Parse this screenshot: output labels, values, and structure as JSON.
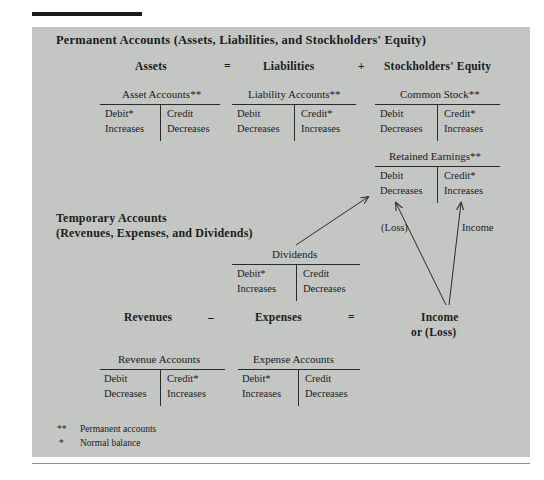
{
  "figure": {
    "permanent_heading": "Permanent Accounts (Assets, Liabilities, and Stockholders' Equity)",
    "temporary_heading_line1": "Temporary Accounts",
    "temporary_heading_line2": "(Revenues, Expenses, and Dividends)"
  },
  "equation_top": {
    "assets": "Assets",
    "equals": "=",
    "liabilities": "Liabilities",
    "plus": "+",
    "stockholders_equity": "Stockholders' Equity"
  },
  "equation_bottom": {
    "revenues": "Revenues",
    "minus": "–",
    "expenses": "Expenses",
    "equals": "=",
    "income_line1": "Income",
    "income_line2": "or (Loss)"
  },
  "t_accounts": [
    {
      "id": "asset-accounts",
      "title": "Asset Accounts**",
      "debit_label": "Debit*",
      "debit_effect": "Increases",
      "credit_label": "Credit",
      "credit_effect": "Decreases"
    },
    {
      "id": "liability-accounts",
      "title": "Liability Accounts**",
      "debit_label": "Debit",
      "debit_effect": "Decreases",
      "credit_label": "Credit*",
      "credit_effect": "Increases"
    },
    {
      "id": "common-stock",
      "title": "Common Stock**",
      "debit_label": "Debit",
      "debit_effect": "Decreases",
      "credit_label": "Credit*",
      "credit_effect": "Increases"
    },
    {
      "id": "retained-earnings",
      "title": "Retained Earnings**",
      "debit_label": "Debit",
      "debit_effect": "Decreases",
      "credit_label": "Credit*",
      "credit_effect": "Increases"
    },
    {
      "id": "dividends",
      "title": "Dividends",
      "debit_label": "Debit*",
      "debit_effect": "Increases",
      "credit_label": "Credit",
      "credit_effect": "Decreases"
    },
    {
      "id": "revenue-accounts",
      "title": "Revenue Accounts",
      "debit_label": "Debit",
      "debit_effect": "Decreases",
      "credit_label": "Credit*",
      "credit_effect": "Increases"
    },
    {
      "id": "expense-accounts",
      "title": "Expense Accounts",
      "debit_label": "Debit*",
      "debit_effect": "Increases",
      "credit_label": "Credit",
      "credit_effect": "Decreases"
    }
  ],
  "flow_labels": {
    "loss": "(Loss)",
    "income": "Income"
  },
  "footnotes": [
    {
      "mark": "**",
      "text": "Permanent accounts"
    },
    {
      "mark": "*",
      "text": "Normal balance"
    }
  ],
  "colors": {
    "panel_background": "#c3c6c3",
    "page_background": "#ffffff",
    "text": "#1c1c1c",
    "rule": "#2a2a2a",
    "top_rule": "#1a1a1a"
  }
}
